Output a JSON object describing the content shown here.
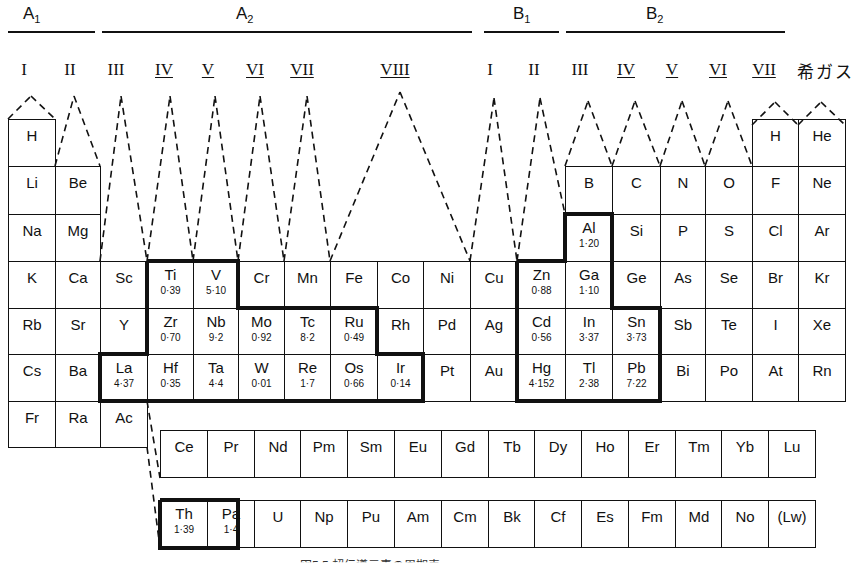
{
  "figure": {
    "group_headers": [
      {
        "label": "A",
        "sub": "1",
        "x": 25,
        "line": [
          8,
          95
        ]
      },
      {
        "label": "A",
        "sub": "2",
        "x": 238,
        "line": [
          102,
          472
        ]
      },
      {
        "label": "B",
        "sub": "1",
        "x": 515,
        "line": [
          484,
          559
        ]
      },
      {
        "label": "B",
        "sub": "2",
        "x": 648,
        "line": [
          566,
          785
        ]
      }
    ],
    "roman_numerals": [
      {
        "label": "I",
        "x": 12,
        "underline": false
      },
      {
        "label": "II",
        "x": 58,
        "underline": false
      },
      {
        "label": "III",
        "x": 104,
        "underline": false
      },
      {
        "label": "IV",
        "x": 152,
        "underline": true
      },
      {
        "label": "V",
        "x": 196,
        "underline": true
      },
      {
        "label": "VI",
        "x": 243,
        "underline": true
      },
      {
        "label": "VII",
        "x": 290,
        "underline": true
      },
      {
        "label": "VIII",
        "x": 383,
        "underline": true
      },
      {
        "label": "I",
        "x": 478,
        "underline": false
      },
      {
        "label": "II",
        "x": 522,
        "underline": false
      },
      {
        "label": "III",
        "x": 568,
        "underline": false
      },
      {
        "label": "IV",
        "x": 614,
        "underline": true
      },
      {
        "label": "V",
        "x": 660,
        "underline": true
      },
      {
        "label": "VI",
        "x": 706,
        "underline": true
      },
      {
        "label": "VII",
        "x": 752,
        "underline": true
      }
    ],
    "noble_gas_label": "希ガス",
    "caption": "図5.5 超伝導元素の周期表",
    "main_table": [
      {
        "sym": "H",
        "col": 0,
        "row": 0
      },
      {
        "sym": "H",
        "col": 16,
        "row": 0
      },
      {
        "sym": "He",
        "col": 17,
        "row": 0
      },
      {
        "sym": "Li",
        "col": 0,
        "row": 1
      },
      {
        "sym": "Be",
        "col": 1,
        "row": 1
      },
      {
        "sym": "B",
        "col": 12,
        "row": 1
      },
      {
        "sym": "C",
        "col": 13,
        "row": 1
      },
      {
        "sym": "N",
        "col": 14,
        "row": 1
      },
      {
        "sym": "O",
        "col": 15,
        "row": 1
      },
      {
        "sym": "F",
        "col": 16,
        "row": 1
      },
      {
        "sym": "Ne",
        "col": 17,
        "row": 1
      },
      {
        "sym": "Na",
        "col": 0,
        "row": 2
      },
      {
        "sym": "Mg",
        "col": 1,
        "row": 2
      },
      {
        "sym": "Al",
        "val": "1·20",
        "col": 12,
        "row": 2
      },
      {
        "sym": "Si",
        "col": 13,
        "row": 2
      },
      {
        "sym": "P",
        "col": 14,
        "row": 2
      },
      {
        "sym": "S",
        "col": 15,
        "row": 2
      },
      {
        "sym": "Cl",
        "col": 16,
        "row": 2
      },
      {
        "sym": "Ar",
        "col": 17,
        "row": 2
      },
      {
        "sym": "K",
        "col": 0,
        "row": 3
      },
      {
        "sym": "Ca",
        "col": 1,
        "row": 3
      },
      {
        "sym": "Sc",
        "col": 2,
        "row": 3
      },
      {
        "sym": "Ti",
        "val": "0·39",
        "col": 3,
        "row": 3
      },
      {
        "sym": "V",
        "val": "5·10",
        "col": 4,
        "row": 3
      },
      {
        "sym": "Cr",
        "col": 5,
        "row": 3
      },
      {
        "sym": "Mn",
        "col": 6,
        "row": 3
      },
      {
        "sym": "Fe",
        "col": 7,
        "row": 3
      },
      {
        "sym": "Co",
        "col": 8,
        "row": 3
      },
      {
        "sym": "Ni",
        "col": 9,
        "row": 3
      },
      {
        "sym": "Cu",
        "col": 10,
        "row": 3
      },
      {
        "sym": "Zn",
        "val": "0·88",
        "col": 11,
        "row": 3
      },
      {
        "sym": "Ga",
        "val": "1·10",
        "col": 12,
        "row": 3
      },
      {
        "sym": "Ge",
        "col": 13,
        "row": 3
      },
      {
        "sym": "As",
        "col": 14,
        "row": 3
      },
      {
        "sym": "Se",
        "col": 15,
        "row": 3
      },
      {
        "sym": "Br",
        "col": 16,
        "row": 3
      },
      {
        "sym": "Kr",
        "col": 17,
        "row": 3
      },
      {
        "sym": "Rb",
        "col": 0,
        "row": 4
      },
      {
        "sym": "Sr",
        "col": 1,
        "row": 4
      },
      {
        "sym": "Y",
        "col": 2,
        "row": 4
      },
      {
        "sym": "Zr",
        "val": "0·70",
        "col": 3,
        "row": 4
      },
      {
        "sym": "Nb",
        "val": "9·2",
        "col": 4,
        "row": 4
      },
      {
        "sym": "Mo",
        "val": "0·92",
        "col": 5,
        "row": 4
      },
      {
        "sym": "Tc",
        "val": "8·2",
        "col": 6,
        "row": 4
      },
      {
        "sym": "Ru",
        "val": "0·49",
        "col": 7,
        "row": 4
      },
      {
        "sym": "Rh",
        "col": 8,
        "row": 4
      },
      {
        "sym": "Pd",
        "col": 9,
        "row": 4
      },
      {
        "sym": "Ag",
        "col": 10,
        "row": 4
      },
      {
        "sym": "Cd",
        "val": "0·56",
        "col": 11,
        "row": 4
      },
      {
        "sym": "In",
        "val": "3·37",
        "col": 12,
        "row": 4
      },
      {
        "sym": "Sn",
        "val": "3·73",
        "col": 13,
        "row": 4
      },
      {
        "sym": "Sb",
        "col": 14,
        "row": 4
      },
      {
        "sym": "Te",
        "col": 15,
        "row": 4
      },
      {
        "sym": "I",
        "col": 16,
        "row": 4
      },
      {
        "sym": "Xe",
        "col": 17,
        "row": 4
      },
      {
        "sym": "Cs",
        "col": 0,
        "row": 5
      },
      {
        "sym": "Ba",
        "col": 1,
        "row": 5
      },
      {
        "sym": "La",
        "val": "4·37",
        "col": 2,
        "row": 5
      },
      {
        "sym": "Hf",
        "val": "0·35",
        "col": 3,
        "row": 5
      },
      {
        "sym": "Ta",
        "val": "4·4",
        "col": 4,
        "row": 5
      },
      {
        "sym": "W",
        "val": "0·01",
        "col": 5,
        "row": 5
      },
      {
        "sym": "Re",
        "val": "1·7",
        "col": 6,
        "row": 5
      },
      {
        "sym": "Os",
        "val": "0·66",
        "col": 7,
        "row": 5
      },
      {
        "sym": "Ir",
        "val": "0·14",
        "col": 8,
        "row": 5
      },
      {
        "sym": "Pt",
        "col": 9,
        "row": 5
      },
      {
        "sym": "Au",
        "col": 10,
        "row": 5
      },
      {
        "sym": "Hg",
        "val": "4·152",
        "col": 11,
        "row": 5
      },
      {
        "sym": "Tl",
        "val": "2·38",
        "col": 12,
        "row": 5
      },
      {
        "sym": "Pb",
        "val": "7·22",
        "col": 13,
        "row": 5
      },
      {
        "sym": "Bi",
        "col": 14,
        "row": 5
      },
      {
        "sym": "Po",
        "col": 15,
        "row": 5
      },
      {
        "sym": "At",
        "col": 16,
        "row": 5
      },
      {
        "sym": "Rn",
        "col": 17,
        "row": 5
      },
      {
        "sym": "Fr",
        "col": 0,
        "row": 6
      },
      {
        "sym": "Ra",
        "col": 1,
        "row": 6
      },
      {
        "sym": "Ac",
        "col": 2,
        "row": 6
      }
    ],
    "lanthanides": [
      {
        "sym": "Ce"
      },
      {
        "sym": "Pr"
      },
      {
        "sym": "Nd"
      },
      {
        "sym": "Pm"
      },
      {
        "sym": "Sm"
      },
      {
        "sym": "Eu"
      },
      {
        "sym": "Gd"
      },
      {
        "sym": "Tb"
      },
      {
        "sym": "Dy"
      },
      {
        "sym": "Ho"
      },
      {
        "sym": "Er"
      },
      {
        "sym": "Tm"
      },
      {
        "sym": "Yb"
      },
      {
        "sym": "Lu"
      }
    ],
    "actinides": [
      {
        "sym": "Th",
        "val": "1·39"
      },
      {
        "sym": "Pa",
        "val": "1·4"
      },
      {
        "sym": "U"
      },
      {
        "sym": "Np"
      },
      {
        "sym": "Pu"
      },
      {
        "sym": "Am"
      },
      {
        "sym": "Cm"
      },
      {
        "sym": "Bk"
      },
      {
        "sym": "Cf"
      },
      {
        "sym": "Es"
      },
      {
        "sym": "Fm"
      },
      {
        "sym": "Md"
      },
      {
        "sym": "No"
      },
      {
        "sym": "(Lw)"
      }
    ]
  }
}
